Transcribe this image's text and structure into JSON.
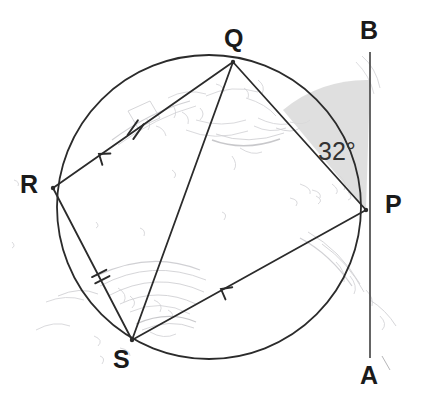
{
  "figure": {
    "type": "circle-geometry-diagram",
    "background_color": "#ffffff",
    "stroke_color": "#2b2b2b",
    "faint_color": "#b9b9bd",
    "shade_color": "#d6d6d6"
  },
  "circle": {
    "center_x": 209,
    "center_y": 207,
    "radius": 152,
    "stroke_width": 1.8
  },
  "points": {
    "Q": {
      "label": "Q",
      "x": 233,
      "y": 62,
      "label_x": 224,
      "label_y": 26
    },
    "R": {
      "label": "R",
      "x": 53,
      "y": 188,
      "label_x": 20,
      "label_y": 172
    },
    "S": {
      "label": "S",
      "x": 132,
      "y": 340,
      "label_x": 113,
      "label_y": 347
    },
    "P": {
      "label": "P",
      "x": 366,
      "y": 210,
      "label_x": 385,
      "label_y": 192
    },
    "B": {
      "label": "B",
      "x": 370,
      "y": 55,
      "label_x": 360,
      "label_y": 18
    },
    "A": {
      "label": "A",
      "x": 370,
      "y": 355,
      "label_x": 360,
      "label_y": 363
    }
  },
  "tangent_line": {
    "name": "AB",
    "x": 370,
    "y_top": 52,
    "y_bottom": 358,
    "stroke_width": 1.6
  },
  "chords": [
    {
      "name": "QR",
      "from": "Q",
      "to": "R",
      "ticks": 2,
      "arrow": true
    },
    {
      "name": "QS",
      "from": "Q",
      "to": "S",
      "ticks": 0,
      "arrow": false
    },
    {
      "name": "QP",
      "from": "Q",
      "to": "P",
      "ticks": 0,
      "arrow": false
    },
    {
      "name": "RS",
      "from": "R",
      "to": "S",
      "ticks": 2,
      "arrow": false
    },
    {
      "name": "SP",
      "from": "S",
      "to": "P",
      "ticks": 0,
      "arrow": true
    }
  ],
  "angle": {
    "label": "32°",
    "value": 32,
    "unit": "degrees",
    "at_point": "P",
    "between": [
      "PQ",
      "PB"
    ],
    "label_x": 318,
    "label_y": 139,
    "shaded": true
  },
  "tick_marks": [
    {
      "on": "QR",
      "x": 136,
      "y": 130,
      "count": 2,
      "angle_deg": 35
    },
    {
      "on": "RS",
      "x": 101,
      "y": 277,
      "count": 2,
      "angle_deg": 63
    }
  ],
  "arrow_marks": [
    {
      "on": "QR",
      "x": 99,
      "y": 154,
      "direction_deg": 215
    },
    {
      "on": "SP",
      "x": 221,
      "y": 289,
      "direction_deg": 213
    }
  ]
}
